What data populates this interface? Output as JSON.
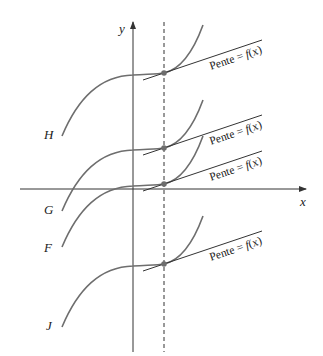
{
  "axes": {
    "x_label": "x",
    "y_label": "y",
    "origin": [
      133,
      189
    ],
    "x_axis": {
      "from": 20,
      "to": 306
    },
    "y_axis": {
      "from": 352,
      "to": 22
    }
  },
  "dashed_line": {
    "x": 164,
    "from": 20,
    "to": 352
  },
  "colors": {
    "curve": "#6e6e6e",
    "axis": "#333333",
    "tangent": "#333333",
    "point": "#6e6e6e",
    "text": "#222222"
  },
  "curves": [
    {
      "name": "H",
      "label": "H",
      "label_pos": [
        44,
        139
      ],
      "offset_y": 73
    },
    {
      "name": "G",
      "label": "G",
      "label_pos": [
        44,
        214
      ],
      "offset_y": 148
    },
    {
      "name": "F",
      "label": "F",
      "label_pos": [
        44,
        252
      ],
      "offset_y": 184
    },
    {
      "name": "J",
      "label": "J",
      "label_pos": [
        46,
        330
      ],
      "offset_y": 264
    }
  ],
  "tangents": [
    {
      "curve": "H",
      "point": [
        164,
        73
      ],
      "label": "Pente = f(x)",
      "label_prefix": "Pente = ",
      "label_fx": "f",
      "label_args": "(x)"
    },
    {
      "curve": "G",
      "point": [
        164,
        148
      ],
      "label": "Pente = f(x)",
      "label_prefix": "Pente = ",
      "label_fx": "f",
      "label_args": "(x)"
    },
    {
      "curve": "F",
      "point": [
        164,
        184
      ],
      "label": "Pente = f(x)",
      "label_prefix": "Pente = ",
      "label_fx": "f",
      "label_args": "(x)"
    },
    {
      "curve": "J",
      "point": [
        164,
        264
      ],
      "label": "Pente = f(x)",
      "label_prefix": "Pente = ",
      "label_fx": "f",
      "label_args": "(x)"
    }
  ]
}
